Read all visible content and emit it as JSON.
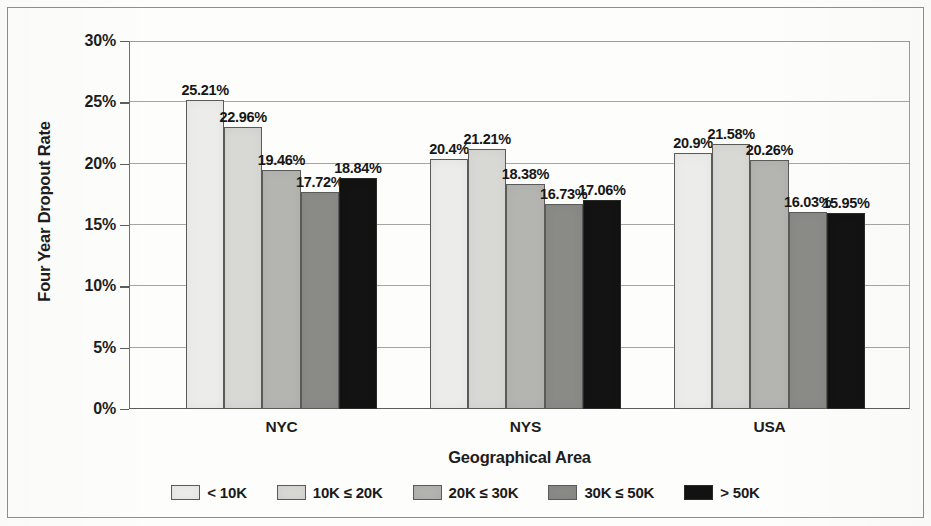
{
  "chart_data": {
    "type": "bar",
    "title": "",
    "xlabel": "Geographical Area",
    "ylabel": "Four Year Dropout Rate",
    "categories": [
      "NYC",
      "NYS",
      "USA"
    ],
    "ylim": [
      0,
      30
    ],
    "ytick_labels": [
      "0%",
      "5%",
      "10%",
      "15%",
      "20%",
      "25%",
      "30%"
    ],
    "ytick_values": [
      0,
      5,
      10,
      15,
      20,
      25,
      30
    ],
    "grid": true,
    "legend_position": "bottom",
    "series": [
      {
        "name": "< 10K",
        "color": "#ececea",
        "values": [
          25.21,
          20.4,
          20.9
        ],
        "labels": [
          "25.21%",
          "20.4%",
          "20.9%"
        ]
      },
      {
        "name": "10K ≤ 20K",
        "color": "#d8d8d4",
        "values": [
          22.96,
          21.21,
          21.58
        ],
        "labels": [
          "22.96%",
          "21.21%",
          "21.58%"
        ]
      },
      {
        "name": "20K ≤ 30K",
        "color": "#b4b4b0",
        "values": [
          19.46,
          18.38,
          20.26
        ],
        "labels": [
          "19.46%",
          "18.38%",
          "20.26%"
        ]
      },
      {
        "name": "30K ≤ 50K",
        "color": "#8a8a86",
        "values": [
          17.72,
          16.73,
          16.03
        ],
        "labels": [
          "17.72%",
          "16.73%",
          "16.03%"
        ]
      },
      {
        "name": "> 50K",
        "color": "#131313",
        "values": [
          18.84,
          17.06,
          15.95
        ],
        "labels": [
          "18.84%",
          "17.06%",
          "15.95%"
        ]
      }
    ]
  }
}
